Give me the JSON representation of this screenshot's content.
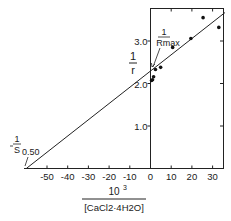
{
  "chart_data": {
    "type": "scatter",
    "title": "",
    "xlabel_numerator": "10³",
    "xlabel_denominator": "[CaCl2·4H2O]",
    "xlabel": "10^3 / [CaCl2·4H2O]",
    "ylabel": "1/r",
    "xlim": [
      -61,
      36
    ],
    "ylim": [
      0,
      3.8
    ],
    "x_ticks": [
      -50,
      -40,
      -30,
      -20,
      -10,
      0,
      10,
      20,
      30
    ],
    "x_tick_labels": [
      "-50",
      "-40",
      "-30",
      "-20",
      "-10",
      "0",
      "10",
      "20",
      "30"
    ],
    "y_ticks": [
      1.0,
      2.0,
      3.0
    ],
    "y_tick_labels": [
      "1.0",
      "2.0",
      "3.0"
    ],
    "grid": false,
    "series": [
      {
        "name": "data",
        "marker": "dot",
        "points": [
          {
            "x": 0.5,
            "y": 2.07
          },
          {
            "x": 1.0,
            "y": 2.09
          },
          {
            "x": 1.5,
            "y": 2.16
          },
          {
            "x": 2.4,
            "y": 2.33
          },
          {
            "x": 4.9,
            "y": 2.38
          },
          {
            "x": 10.7,
            "y": 2.85
          },
          {
            "x": 19.5,
            "y": 3.06
          },
          {
            "x": 25.4,
            "y": 3.55
          },
          {
            "x": 33.0,
            "y": 3.32
          }
        ]
      },
      {
        "name": "fit line",
        "type": "line",
        "points": [
          {
            "x": -60,
            "y": 0
          },
          {
            "x": 36,
            "y": 3.67
          }
        ]
      }
    ],
    "annotations": [
      {
        "text": "1/Rmax",
        "numerator": "1",
        "denominator": "Rmax",
        "points_to": {
          "x": 0,
          "y": 2.3
        }
      },
      {
        "text": "-1/S0.50",
        "numerator": "1",
        "denominator": "S",
        "subscript": "0.50",
        "points_to": {
          "x": -60,
          "y": 0
        }
      }
    ]
  }
}
